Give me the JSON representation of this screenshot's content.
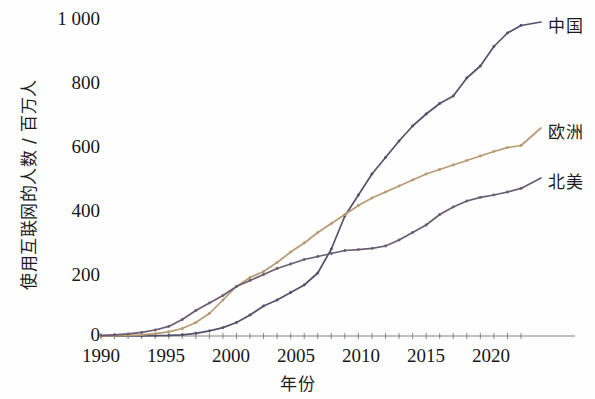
{
  "chart_data": {
    "type": "line",
    "title": "",
    "xlabel": "年份",
    "ylabel": "使用互联网的人数 / 百万人",
    "xlim": [
      1990,
      2021
    ],
    "ylim": [
      0,
      1060
    ],
    "grid": false,
    "legend_position": "right-of-axes",
    "x_ticks": [
      "1990",
      "1995",
      "2000",
      "2005",
      "2010",
      "2015",
      "2020"
    ],
    "x_tick_values": [
      1990,
      1995,
      2000,
      2005,
      2010,
      2015,
      2020
    ],
    "y_ticks": [
      "0",
      "200",
      "400",
      "600",
      "800",
      "1 000"
    ],
    "y_tick_values": [
      0,
      200,
      400,
      600,
      800,
      1000
    ],
    "x": [
      1990,
      1991,
      1992,
      1993,
      1994,
      1995,
      1996,
      1997,
      1998,
      1999,
      2000,
      2001,
      2002,
      2003,
      2004,
      2005,
      2006,
      2007,
      2008,
      2009,
      2010,
      2011,
      2012,
      2013,
      2014,
      2015,
      2016,
      2017,
      2018,
      2019,
      2020,
      2021
    ],
    "series": [
      {
        "name": "中国",
        "color": "#54526b",
        "values": [
          0,
          0,
          0,
          0,
          1,
          2,
          4,
          9,
          17,
          28,
          45,
          70,
          100,
          120,
          145,
          170,
          210,
          290,
          400,
          470,
          540,
          595,
          650,
          700,
          740,
          775,
          800,
          860,
          900,
          965,
          1010,
          1035
        ]
      },
      {
        "name": "欧洲",
        "color": "#b79b72",
        "values": [
          0,
          1,
          2,
          4,
          8,
          14,
          25,
          45,
          75,
          120,
          165,
          195,
          215,
          245,
          280,
          310,
          345,
          375,
          405,
          435,
          460,
          480,
          500,
          520,
          540,
          555,
          570,
          585,
          600,
          615,
          628,
          635
        ]
      },
      {
        "name": "北美",
        "color": "#6b5c72",
        "values": [
          2,
          4,
          7,
          12,
          20,
          32,
          55,
          85,
          110,
          135,
          165,
          185,
          205,
          225,
          240,
          255,
          265,
          275,
          285,
          288,
          292,
          300,
          320,
          345,
          370,
          405,
          430,
          450,
          462,
          470,
          480,
          492
        ]
      }
    ]
  },
  "legend": {
    "items": [
      {
        "label": "中国",
        "color": "#54526b"
      },
      {
        "label": "欧洲",
        "color": "#b79b72"
      },
      {
        "label": "北美",
        "color": "#6b5c72"
      }
    ]
  }
}
